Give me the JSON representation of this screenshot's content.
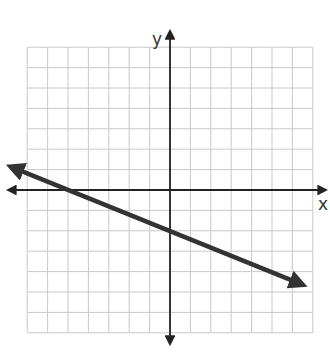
{
  "chart_data": {
    "type": "line",
    "title": "",
    "xlabel": "x",
    "ylabel": "y",
    "xlim": [
      -7,
      7
    ],
    "ylim": [
      -7,
      7
    ],
    "grid": true,
    "grid_step": 1,
    "series": [
      {
        "name": "line",
        "slope": -0.4,
        "intercept": -2,
        "x": [
          -7.7,
          -5,
          0,
          5,
          6.4
        ],
        "y": [
          1.1,
          0,
          -2,
          -4,
          -4.6
        ],
        "arrows_both_ends": true
      }
    ],
    "key_points": {
      "x_intercept": [
        -5,
        0
      ],
      "y_intercept": [
        0,
        -2
      ]
    }
  },
  "labels": {
    "x_axis": "x",
    "y_axis": "y"
  },
  "colors": {
    "grid": "#c8c8c8",
    "axis": "#222222",
    "line": "#333333",
    "background": "#ffffff"
  }
}
